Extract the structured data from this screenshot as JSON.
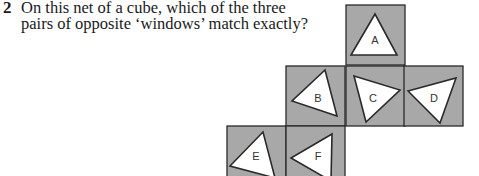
{
  "question": {
    "number": "2",
    "lines": [
      "On this net of a cube, which of the three",
      "pairs of opposite ‘windows’ match exactly?"
    ]
  },
  "net": {
    "face_color": "#a8a8a8",
    "border_color": "#2a2a2a",
    "window_color": "#ffffff",
    "faces": [
      {
        "label": "A",
        "x": 346,
        "y": 5,
        "tri": "375,14 351,55 397,55",
        "lx": 375,
        "ly": 44
      },
      {
        "label": "B",
        "x": 286,
        "y": 66,
        "tri": "325,70 292,101 337,116",
        "lx": 318,
        "ly": 102
      },
      {
        "label": "C",
        "x": 346,
        "y": 66,
        "tri": "354,76 400,90 366,122",
        "lx": 373,
        "ly": 102
      },
      {
        "label": "D",
        "x": 404,
        "y": 66,
        "tri": "408,91 456,78 440,123",
        "lx": 434,
        "ly": 102
      },
      {
        "label": "E",
        "x": 227,
        "y": 126,
        "tri": "263,132 230,166 275,178",
        "lx": 256,
        "ly": 160
      },
      {
        "label": "F",
        "x": 286,
        "y": 126,
        "tri": "332,134 291,158 331,181",
        "lx": 318,
        "ly": 160
      }
    ]
  }
}
